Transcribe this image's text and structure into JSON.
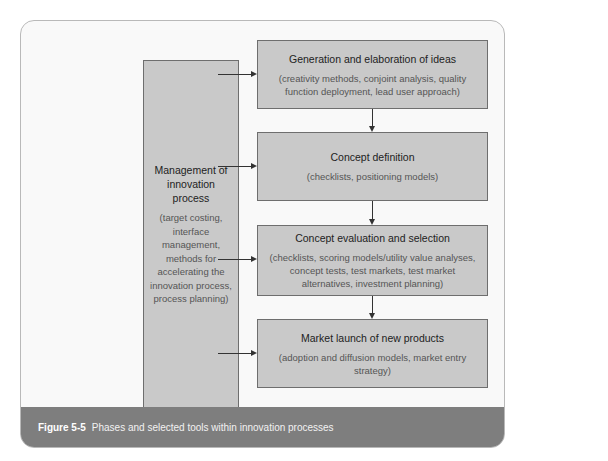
{
  "diagram": {
    "left_box": {
      "title": "Management of innovation process",
      "tools": "(target costing, interface management, methods for accelerating the innovation process, process planning)"
    },
    "phases": [
      {
        "title": "Generation and elaboration of ideas",
        "tools": "(creativity methods, conjoint analysis, quality function deployment, lead user approach)"
      },
      {
        "title": "Concept definition",
        "tools": "(checklists, positioning models)"
      },
      {
        "title": "Concept evaluation and selection",
        "tools": "(checklists, scoring models/utility value analyses, concept tests, test markets, test market alternatives, investment planning)"
      },
      {
        "title": "Market launch of new products",
        "tools": "(adoption and diffusion models, market entry strategy)"
      }
    ]
  },
  "caption": {
    "label": "Figure 5-5",
    "text": "Phases and selected tools within innovation processes"
  },
  "colors": {
    "box_fill": "#c9c9c9",
    "caption_bar": "#7e7e7e",
    "frame_border": "#b9b9b9"
  }
}
